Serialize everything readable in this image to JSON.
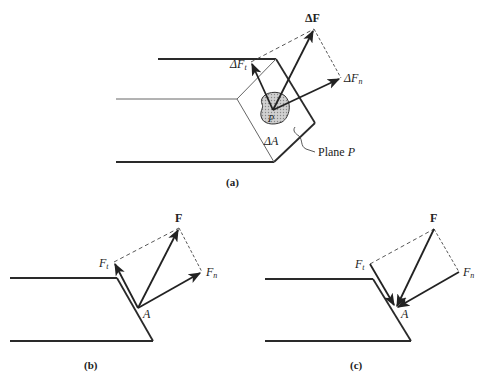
{
  "figure_a": {
    "caption": "(a)",
    "vector_total": "ΔF",
    "vector_tangent_prefix": "ΔF",
    "vector_tangent_sub": "t",
    "vector_normal_prefix": "ΔF",
    "vector_normal_sub": "n",
    "area_label": "ΔA",
    "point_label": "P",
    "plane_label": "Plane ",
    "plane_label_italic": "P"
  },
  "figure_b": {
    "caption": "(b)",
    "vector_total": "F",
    "vector_tangent": "F",
    "vector_tangent_sub": "t",
    "vector_normal": "F",
    "vector_normal_sub": "n",
    "point_label": "A"
  },
  "figure_c": {
    "caption": "(c)",
    "vector_total": "F",
    "vector_tangent": "F",
    "vector_tangent_sub": "t",
    "vector_normal": "F",
    "vector_normal_sub": "n",
    "point_label": "A"
  },
  "colors": {
    "line": "#2a2a2a",
    "thin_line": "#555555",
    "shade": "#bdbdbd"
  }
}
